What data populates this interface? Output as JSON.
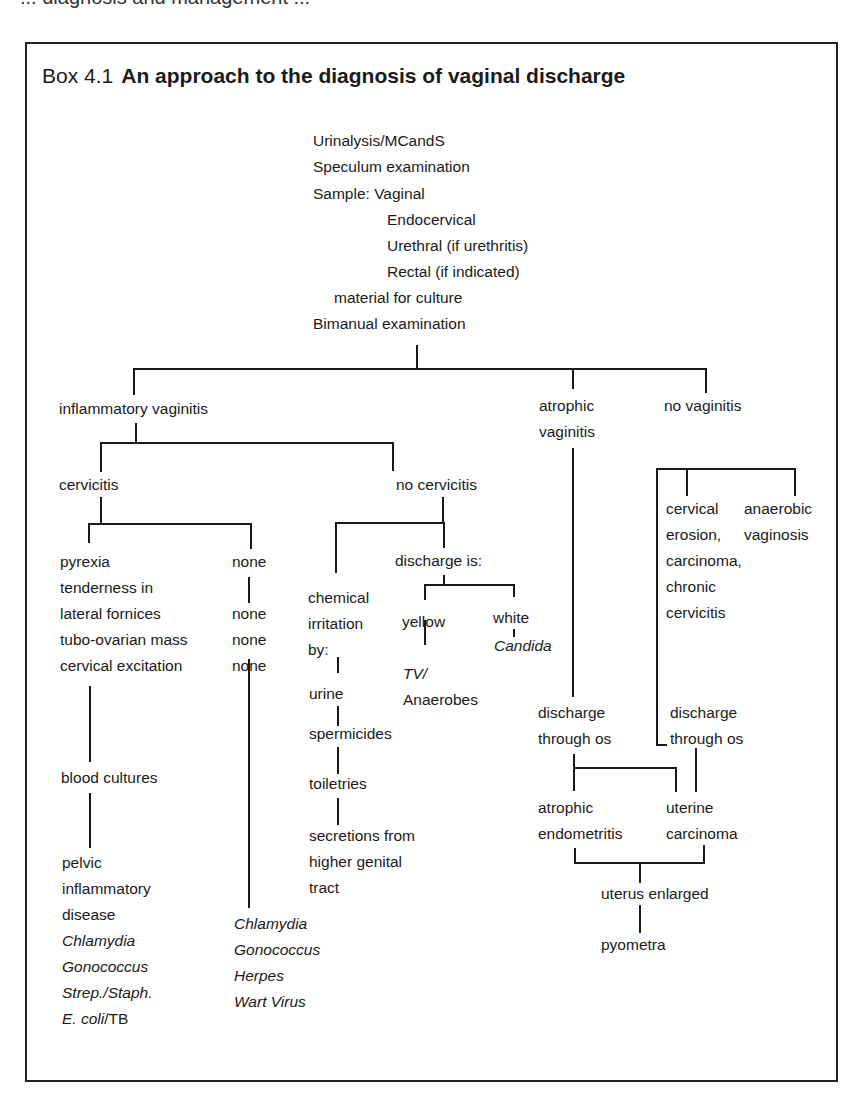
{
  "page": {
    "top_fragment": "... diagnosis and management ...",
    "box_label": "Box 4.1",
    "box_title": "An approach to the diagnosis of vaginal discharge"
  },
  "initial_steps": {
    "lines": [
      "Urinalysis/MCandS",
      "Speculum examination",
      "Sample: Vaginal",
      "Endocervical",
      "Urethral (if urethritis)",
      "Rectal (if indicated)",
      "material for culture",
      "Bimanual examination"
    ]
  },
  "level1": {
    "inflammatory": "inflammatory vaginitis",
    "atrophic_1": "atrophic",
    "atrophic_2": "vaginitis",
    "no_vaginitis": "no vaginitis"
  },
  "inflammatory_branch": {
    "cervicitis": "cervicitis",
    "no_cervicitis": "no cervicitis",
    "cervicitis_signs": [
      "pyrexia",
      "tenderness in",
      "lateral fornices",
      "tubo-ovarian mass",
      "cervical excitation"
    ],
    "none_column": [
      "none",
      "none",
      "none",
      "none"
    ],
    "blood_cultures": "blood cultures",
    "pid": [
      "pelvic",
      "inflammatory",
      "disease"
    ],
    "pid_organisms": [
      "Chlamydia",
      "Gonococcus",
      "Strep./Staph."
    ],
    "pid_last_italic": "E. coli",
    "pid_last_plain": "/TB",
    "none_organisms": [
      "Chlamydia",
      "Gonococcus",
      "Herpes",
      "Wart Virus"
    ]
  },
  "no_cervicitis_branch": {
    "chemical": [
      "chemical",
      "irritation",
      "by:"
    ],
    "irritants": [
      "urine",
      "spermicides",
      "toiletries"
    ],
    "secretions": [
      "secretions from",
      "higher genital",
      "tract"
    ],
    "discharge_is": "discharge is:",
    "yellow": "yellow",
    "white": "white",
    "yellow_cause_1": "TV/",
    "yellow_cause_2": "Anaerobes",
    "white_cause": "Candida"
  },
  "atrophic_branch": {
    "discharge_os": [
      "discharge",
      "through os"
    ],
    "atrophic_endo": [
      "atrophic",
      "endometritis"
    ],
    "uterine_ca": [
      "uterine",
      "carcinoma"
    ],
    "uterus_enlarged": "uterus enlarged",
    "pyometra": "pyometra"
  },
  "no_vaginitis_branch": {
    "cervical": [
      "cervical",
      "erosion,",
      "carcinoma,",
      "chronic",
      "cervicitis"
    ],
    "anaerobic": [
      "anaerobic",
      "vaginosis"
    ],
    "discharge_os": [
      "discharge",
      "through os"
    ]
  }
}
